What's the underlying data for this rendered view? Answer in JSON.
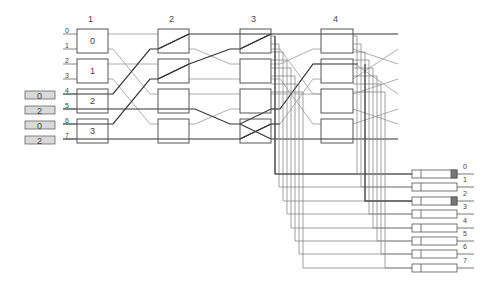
{
  "diagram": {
    "stages": [
      {
        "label": "1",
        "boxes": [
          "0",
          "1",
          "2",
          "3"
        ]
      },
      {
        "label": "2",
        "boxes": [
          "",
          "",
          "",
          ""
        ]
      },
      {
        "label": "3",
        "boxes": [
          "",
          "",
          "",
          ""
        ]
      },
      {
        "label": "4",
        "boxes": [
          "",
          "",
          "",
          ""
        ]
      }
    ],
    "input_ports": [
      "0",
      "1",
      "2",
      "3",
      "4",
      "5",
      "6",
      "7"
    ],
    "input_tags": [
      {
        "port": "4",
        "value": "0"
      },
      {
        "port": "5",
        "value": "2"
      },
      {
        "port": "6",
        "value": "0"
      },
      {
        "port": "7",
        "value": "2"
      }
    ],
    "output_ports": [
      {
        "label": "0",
        "marked": true
      },
      {
        "label": "1",
        "marked": false
      },
      {
        "label": "2",
        "marked": true
      },
      {
        "label": "3",
        "marked": false
      },
      {
        "label": "4",
        "marked": false
      },
      {
        "label": "5",
        "marked": false
      },
      {
        "label": "6",
        "marked": false
      },
      {
        "label": "7",
        "marked": false
      }
    ],
    "colors": {
      "line_dark": "#333333",
      "line_light": "#999999",
      "box_stroke": "#555555",
      "tag_fill": "#d9d9d9",
      "marker_fill": "#777777"
    }
  }
}
